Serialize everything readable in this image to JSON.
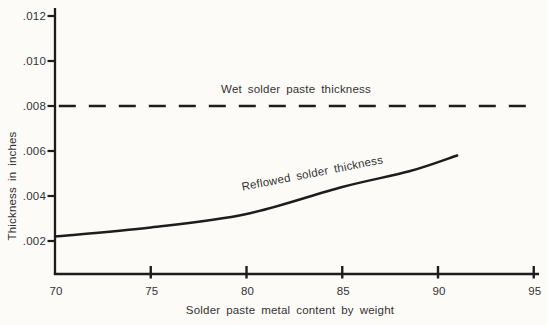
{
  "figure": {
    "background": "#fcfbf8",
    "ink_color": "#1d1d1d",
    "text_color": "#333333"
  },
  "chart_data": {
    "type": "line",
    "title": "",
    "xlabel": "Solder paste metal content by weight",
    "ylabel": "Thickness in inches",
    "xlim": [
      70,
      95
    ],
    "ylim": [
      0.0005,
      0.0125
    ],
    "grid": false,
    "legend_position": "inline-annotations",
    "x_ticks": [
      70,
      75,
      80,
      85,
      90,
      95
    ],
    "x_tick_labels": [
      "70",
      "75",
      "80",
      "85",
      "90",
      "95"
    ],
    "y_ticks": [
      0.002,
      0.004,
      0.006,
      0.008,
      0.01,
      0.012
    ],
    "y_tick_labels": [
      ".002",
      ".004",
      ".006",
      ".008",
      ".010",
      ".012"
    ],
    "series": [
      {
        "name": "wet-solder-paste-thickness",
        "label_text": "Wet solder paste thickness",
        "style": "dashed",
        "x": [
          70.2,
          94.6
        ],
        "y": [
          0.008,
          0.008
        ]
      },
      {
        "name": "reflowed-solder-thickness",
        "label_text": "Reflowed solder thickness",
        "style": "solid",
        "x": [
          70,
          75,
          80,
          85,
          88.5,
          91
        ],
        "y": [
          0.0022,
          0.0026,
          0.0032,
          0.0044,
          0.0051,
          0.0058
        ]
      }
    ]
  }
}
